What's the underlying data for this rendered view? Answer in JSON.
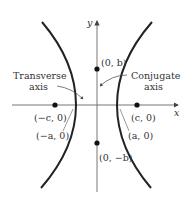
{
  "diagram": {
    "axes": {
      "x_label": "x",
      "y_label": "y"
    },
    "points": [
      {
        "id": "focus-left",
        "label": "(−c, 0)"
      },
      {
        "id": "vertex-left",
        "label": "(−a, 0)"
      },
      {
        "id": "focus-right",
        "label": "(c, 0)"
      },
      {
        "id": "vertex-right",
        "label": "(a, 0)"
      },
      {
        "id": "co-vertex-top",
        "label": "(0, b)"
      },
      {
        "id": "co-vertex-bottom",
        "label": "(0, −b)"
      }
    ],
    "annotations": {
      "transverse_line1": "Transverse",
      "transverse_line2": "axis",
      "conjugate_line1": "Conjugate",
      "conjugate_line2": "axis"
    },
    "colors": {
      "curve": "#222222",
      "axis": "#555555",
      "text": "#333333"
    }
  }
}
